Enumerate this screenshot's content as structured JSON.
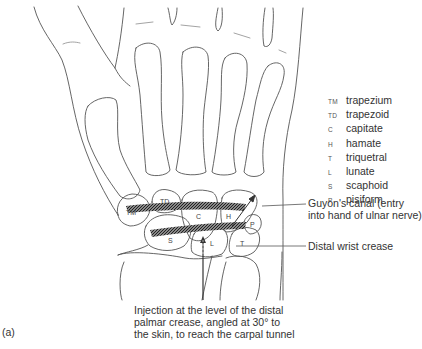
{
  "figure": {
    "label": "(a)"
  },
  "legend": [
    {
      "abbr": "TM",
      "name": "trapezium"
    },
    {
      "abbr": "TD",
      "name": "trapezoid"
    },
    {
      "abbr": "C",
      "name": "capitate"
    },
    {
      "abbr": "H",
      "name": "hamate"
    },
    {
      "abbr": "T",
      "name": "triquetral"
    },
    {
      "abbr": "L",
      "name": "lunate"
    },
    {
      "abbr": "S",
      "name": "scaphoid"
    },
    {
      "abbr": "P",
      "name": "pisiform"
    }
  ],
  "annotations": {
    "guyon_line1": "Guyon's canal (entry",
    "guyon_line2": "into hand of ulnar nerve)",
    "distal_crease": "Distal wrist crease",
    "injection_line1": "Injection at the level of the distal",
    "injection_line2": "palmar crease, angled at 30° to",
    "injection_line3": "the skin, to reach the carpal tunnel"
  },
  "bone_labels": {
    "tm": "TM",
    "td": "TD",
    "c": "C",
    "h": "H",
    "p": "P",
    "s": "S",
    "l": "L",
    "t": "T"
  },
  "colors": {
    "line": "#555555",
    "text": "#333333",
    "ligament": "#3a3a3a"
  }
}
